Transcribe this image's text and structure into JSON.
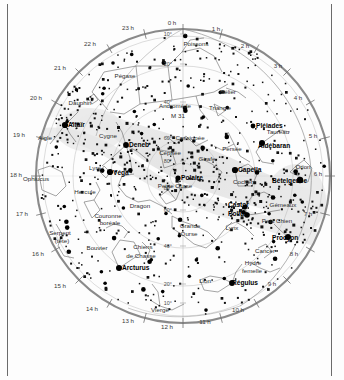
{
  "chart_data": {
    "type": "scatter",
    "projection": "polar / stereographic, pole at center",
    "grid": true,
    "legend_position": "none",
    "xlabel": "Ascension droite (h)",
    "ylabel": "Déclinaison (°)",
    "radial_axis": {
      "name": "declination",
      "unit": "degrees",
      "center_value": 90,
      "edge_value": 0,
      "tick_labels": [
        "10°",
        "20°",
        "40°",
        "60°",
        "80°"
      ],
      "ticks_upper": [
        {
          "label": "10°",
          "y": 36
        },
        {
          "label": "20°",
          "y": 66
        },
        {
          "label": "40°",
          "y": 104
        },
        {
          "label": "60°",
          "y": 140
        },
        {
          "label": "80°",
          "y": 163
        }
      ],
      "ticks_lower": [
        {
          "label": "80°",
          "y": 190
        },
        {
          "label": "60°",
          "y": 212
        },
        {
          "label": "40°",
          "y": 248
        },
        {
          "label": "20°",
          "y": 286
        },
        {
          "label": "10°",
          "y": 305
        }
      ]
    },
    "angular_axis": {
      "name": "right ascension",
      "unit": "hours",
      "tick_labels": [
        "0 h",
        "1 h",
        "2 h",
        "3 h",
        "4 h",
        "5 h",
        "6 h",
        "7 h",
        "8 h",
        "9 h",
        "10 h",
        "11 h",
        "12 h",
        "13 h",
        "14 h",
        "15 h",
        "16 h",
        "17 h",
        "18 h",
        "19 h",
        "20 h",
        "21 h",
        "22 h",
        "23 h"
      ]
    },
    "series": [
      {
        "name": "Étoiles",
        "marker": "square/disc, size by magnitude"
      },
      {
        "name": "Voie lactée",
        "marker": "grey band"
      }
    ]
  },
  "hour_labels": [
    {
      "text": "0 h",
      "x": 172,
      "y": 25
    },
    {
      "text": "1 h",
      "x": 216,
      "y": 31
    },
    {
      "text": "2 h",
      "x": 245,
      "y": 48
    },
    {
      "text": "3 h",
      "x": 278,
      "y": 68
    },
    {
      "text": "4 h",
      "x": 298,
      "y": 100
    },
    {
      "text": "5 h",
      "x": 313,
      "y": 138
    },
    {
      "text": "6 h",
      "x": 318,
      "y": 176
    },
    {
      "text": "7 h",
      "x": 308,
      "y": 216
    },
    {
      "text": "8 h",
      "x": 294,
      "y": 256
    },
    {
      "text": "9 h",
      "x": 272,
      "y": 286
    },
    {
      "text": "10 h",
      "x": 238,
      "y": 312
    },
    {
      "text": "11 h",
      "x": 205,
      "y": 324
    },
    {
      "text": "12 h",
      "x": 167,
      "y": 329
    },
    {
      "text": "13 h",
      "x": 128,
      "y": 323
    },
    {
      "text": "14 h",
      "x": 92,
      "y": 311
    },
    {
      "text": "15 h",
      "x": 60,
      "y": 288
    },
    {
      "text": "16 h",
      "x": 38,
      "y": 256
    },
    {
      "text": "17 h",
      "x": 22,
      "y": 216
    },
    {
      "text": "18 h",
      "x": 16,
      "y": 177
    },
    {
      "text": "19 h",
      "x": 19,
      "y": 137
    },
    {
      "text": "20 h",
      "x": 36,
      "y": 100
    },
    {
      "text": "21 h",
      "x": 60,
      "y": 70
    },
    {
      "text": "22 h",
      "x": 90,
      "y": 46
    },
    {
      "text": "23 h",
      "x": 128,
      "y": 30
    }
  ],
  "bright_stars": [
    {
      "name": "Altaïr",
      "x": 65,
      "y": 125,
      "lx": 68,
      "ly": 127,
      "r": 3.1
    },
    {
      "name": "Deneb",
      "x": 126,
      "y": 145,
      "lx": 129,
      "ly": 147,
      "r": 2.9
    },
    {
      "name": "Véga",
      "x": 110,
      "y": 172,
      "lx": 113,
      "ly": 175,
      "r": 3.1
    },
    {
      "name": "Polaire",
      "x": 178,
      "y": 178,
      "lx": 181,
      "ly": 180,
      "r": 2.6
    },
    {
      "name": "Capella",
      "x": 235,
      "y": 170,
      "lx": 238,
      "ly": 172,
      "r": 3.1
    },
    {
      "name": "Alébebaran",
      "x": 262,
      "y": 143,
      "lx": 258,
      "ly": 148,
      "r": 3.0,
      "label": "Aldébaran"
    },
    {
      "name": "Bételgeuse",
      "x": 300,
      "y": 180,
      "lx": 272,
      "ly": 183,
      "r": 3.2
    },
    {
      "name": "Castor",
      "x": 245,
      "y": 207,
      "lx": 228,
      "ly": 207,
      "r": 2.4
    },
    {
      "name": "Pollux",
      "x": 247,
      "y": 215,
      "lx": 228,
      "ly": 216,
      "r": 2.8
    },
    {
      "name": "Procyon",
      "x": 288,
      "y": 237,
      "lx": 272,
      "ly": 240,
      "r": 3.0
    },
    {
      "name": "Régulus",
      "x": 232,
      "y": 283,
      "lx": 232,
      "ly": 285,
      "r": 2.9
    },
    {
      "name": "Arcturus",
      "x": 119,
      "y": 268,
      "lx": 122,
      "ly": 270,
      "r": 3.0
    },
    {
      "name": "Pléiades",
      "x": 253,
      "y": 126,
      "lx": 256,
      "ly": 128,
      "r": 2.4
    }
  ],
  "constellations": [
    {
      "name": "Pégase",
      "x": 125,
      "y": 78
    },
    {
      "name": "Poissons",
      "x": 196,
      "y": 46
    },
    {
      "name": "Andromède",
      "x": 175,
      "y": 108
    },
    {
      "name": "M 31",
      "x": 178,
      "y": 118
    },
    {
      "name": "Bélier",
      "x": 228,
      "y": 94
    },
    {
      "name": "Triangle",
      "x": 220,
      "y": 110
    },
    {
      "name": "Taureau",
      "x": 278,
      "y": 134
    },
    {
      "name": "Orion",
      "x": 303,
      "y": 169
    },
    {
      "name": "Dauphin",
      "x": 80,
      "y": 105
    },
    {
      "name": "Aigle",
      "x": 45,
      "y": 140
    },
    {
      "name": "Cygne",
      "x": 108,
      "y": 138
    },
    {
      "name": "Cassiopée",
      "x": 190,
      "y": 140
    },
    {
      "name": "Céphée",
      "x": 170,
      "y": 155
    },
    {
      "name": "Persée",
      "x": 232,
      "y": 151
    },
    {
      "name": "Girafe",
      "x": 207,
      "y": 161
    },
    {
      "name": "Lyre",
      "x": 95,
      "y": 170
    },
    {
      "name": "Ophiucus",
      "x": 36,
      "y": 181
    },
    {
      "name": "Cocher",
      "x": 243,
      "y": 184
    },
    {
      "name": "Petite Ourse",
      "x": 175,
      "y": 188
    },
    {
      "name": "Hercule",
      "x": 85,
      "y": 194
    },
    {
      "name": "Dragon",
      "x": 140,
      "y": 208
    },
    {
      "name": "Gémeaux",
      "x": 283,
      "y": 207
    },
    {
      "name": "Lynx",
      "x": 232,
      "y": 230
    },
    {
      "name": "Petit Chien",
      "x": 277,
      "y": 223
    },
    {
      "name": "Couronne",
      "x": 108,
      "y": 218
    },
    {
      "name": "boréale",
      "x": 110,
      "y": 225
    },
    {
      "name": "Grande",
      "x": 190,
      "y": 228
    },
    {
      "name": "Ourse",
      "x": 189,
      "y": 236
    },
    {
      "name": "Serpent",
      "x": 60,
      "y": 235
    },
    {
      "name": "(tête)",
      "x": 62,
      "y": 243
    },
    {
      "name": "Bouvier",
      "x": 97,
      "y": 250
    },
    {
      "name": "Chiens",
      "x": 143,
      "y": 249
    },
    {
      "name": "de Chasse",
      "x": 141,
      "y": 258
    },
    {
      "name": "Cancer",
      "x": 265,
      "y": 253
    },
    {
      "name": "Hydre",
      "x": 253,
      "y": 265
    },
    {
      "name": "femelle",
      "x": 252,
      "y": 273
    },
    {
      "name": "Lion",
      "x": 205,
      "y": 283
    },
    {
      "name": "Vierge",
      "x": 160,
      "y": 312
    }
  ],
  "caption": "",
  "colors": {
    "circle_outline": "#8a8a8a",
    "grid": "#9a9a9a",
    "star": "#000000",
    "milky_way": "#e4e4e4",
    "background": "#fdfdfd",
    "constellation_line": "#555555",
    "border": "#6b6b6b"
  }
}
